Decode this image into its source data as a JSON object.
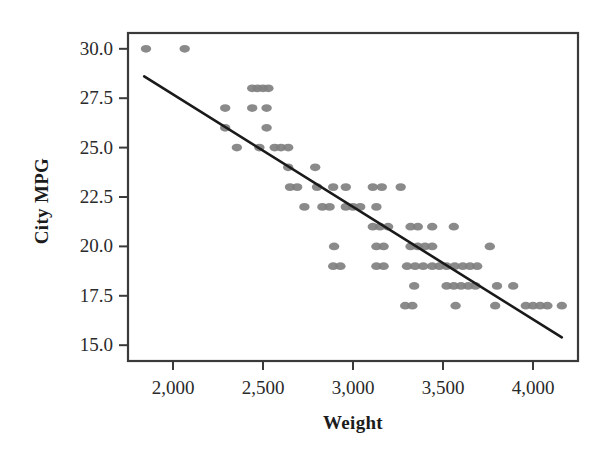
{
  "chart_data": {
    "type": "scatter",
    "title": "",
    "xlabel": "Weight",
    "ylabel": "City MPG",
    "xlim": [
      1750,
      4250
    ],
    "ylim": [
      14.2,
      30.8
    ],
    "grid": false,
    "legend": "none",
    "xticks": [
      2000,
      2500,
      3000,
      3500,
      4000
    ],
    "xtick_labels": [
      "2,000",
      "2,500",
      "3,000",
      "3,500",
      "4,000"
    ],
    "yticks": [
      15.0,
      17.5,
      20.0,
      22.5,
      25.0,
      27.5,
      30.0
    ],
    "ytick_labels": [
      "15.0",
      "17.5",
      "20.0",
      "22.5",
      "25.0",
      "27.5",
      "30.0"
    ],
    "marker_color": "#808080",
    "line_color": "#1a1a1a",
    "frame_color": "#3a3a3a",
    "marker_size": 9,
    "fit_line": {
      "type": "linear",
      "x_start": 1840,
      "y_start": 28.6,
      "x_end": 4160,
      "y_end": 15.4
    },
    "points": [
      [
        1850,
        30.0
      ],
      [
        2065,
        30.0
      ],
      [
        2440,
        28.0
      ],
      [
        2470,
        28.0
      ],
      [
        2500,
        28.0
      ],
      [
        2530,
        28.0
      ],
      [
        2290,
        27.0
      ],
      [
        2440,
        27.0
      ],
      [
        2520,
        27.0
      ],
      [
        2290,
        26.0
      ],
      [
        2520,
        26.0
      ],
      [
        2355,
        25.0
      ],
      [
        2480,
        25.0
      ],
      [
        2565,
        25.0
      ],
      [
        2600,
        25.0
      ],
      [
        2640,
        25.0
      ],
      [
        2640,
        24.0
      ],
      [
        2790,
        24.0
      ],
      [
        2650,
        23.0
      ],
      [
        2690,
        23.0
      ],
      [
        2800,
        23.0
      ],
      [
        2890,
        23.0
      ],
      [
        2960,
        23.0
      ],
      [
        3110,
        23.0
      ],
      [
        3160,
        23.0
      ],
      [
        3265,
        23.0
      ],
      [
        2730,
        22.0
      ],
      [
        2830,
        22.0
      ],
      [
        2870,
        22.0
      ],
      [
        2960,
        22.0
      ],
      [
        3000,
        22.0
      ],
      [
        3040,
        22.0
      ],
      [
        3130,
        22.0
      ],
      [
        3110,
        21.0
      ],
      [
        3150,
        21.0
      ],
      [
        3195,
        21.0
      ],
      [
        3320,
        21.0
      ],
      [
        3360,
        21.0
      ],
      [
        3440,
        21.0
      ],
      [
        3560,
        21.0
      ],
      [
        2895,
        20.0
      ],
      [
        3130,
        20.0
      ],
      [
        3170,
        20.0
      ],
      [
        3320,
        20.0
      ],
      [
        3360,
        20.0
      ],
      [
        3400,
        20.0
      ],
      [
        3440,
        20.0
      ],
      [
        3760,
        20.0
      ],
      [
        2890,
        19.0
      ],
      [
        2930,
        19.0
      ],
      [
        3130,
        19.0
      ],
      [
        3170,
        19.0
      ],
      [
        3300,
        19.0
      ],
      [
        3345,
        19.0
      ],
      [
        3390,
        19.0
      ],
      [
        3440,
        19.0
      ],
      [
        3480,
        19.0
      ],
      [
        3520,
        19.0
      ],
      [
        3565,
        19.0
      ],
      [
        3610,
        19.0
      ],
      [
        3650,
        19.0
      ],
      [
        3690,
        19.0
      ],
      [
        3340,
        18.0
      ],
      [
        3520,
        18.0
      ],
      [
        3560,
        18.0
      ],
      [
        3600,
        18.0
      ],
      [
        3640,
        18.0
      ],
      [
        3680,
        18.0
      ],
      [
        3800,
        18.0
      ],
      [
        3890,
        18.0
      ],
      [
        3290,
        17.0
      ],
      [
        3330,
        17.0
      ],
      [
        3570,
        17.0
      ],
      [
        3790,
        17.0
      ],
      [
        3960,
        17.0
      ],
      [
        4000,
        17.0
      ],
      [
        4040,
        17.0
      ],
      [
        4080,
        17.0
      ],
      [
        4160,
        17.0
      ]
    ]
  }
}
